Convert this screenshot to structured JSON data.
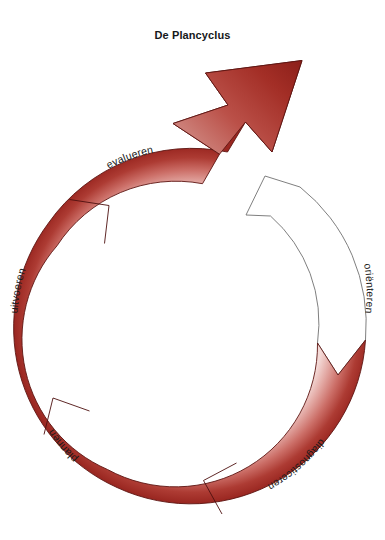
{
  "diagram": {
    "title": "De Plancyclus",
    "type": "circular-process-cycle",
    "direction": "counter-clockwise",
    "segments": [
      {
        "id": "orienteren",
        "label": "oriënteren",
        "fill": "white",
        "stroke": "#6e6e6e",
        "position": "right"
      },
      {
        "id": "diagnosticeren",
        "label": "diagnosticeren",
        "fill": "red",
        "stroke": "#5a1412",
        "position": "bottom-right"
      },
      {
        "id": "plannen",
        "label": "plannen",
        "fill": "red",
        "stroke": "#5a1412",
        "position": "bottom-left"
      },
      {
        "id": "uitvoeren",
        "label": "uitvoeren",
        "fill": "red",
        "stroke": "#5a1412",
        "position": "left"
      },
      {
        "id": "evalueren",
        "label": "evalueren",
        "fill": "red",
        "stroke": "#5a1412",
        "position": "top-left"
      }
    ],
    "colors": {
      "red_dark": "#9e2a23",
      "red_mid": "#c0504d",
      "red_light": "#f2d4d2",
      "outline_red": "#5d1512",
      "outline_white": "#717171",
      "title": "#15171a",
      "background": "#ffffff"
    },
    "arrowheads": [
      {
        "id": "evalueren-arrowhead",
        "fill": "red",
        "points_to": "up-right"
      },
      {
        "id": "orienteren-arrowhead",
        "fill": "white",
        "points_to": "up-left"
      }
    ]
  }
}
